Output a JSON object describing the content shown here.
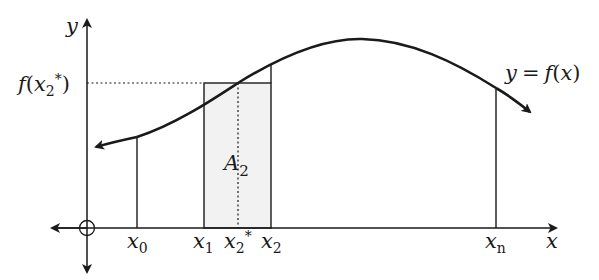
{
  "diagram": {
    "colors": {
      "stroke": "#1a1a1a",
      "rect_fill": "#f2f2f2",
      "background": "#ffffff"
    },
    "axes": {
      "x_label": "x",
      "y_label": "y",
      "origin_marker": "circle-plus"
    },
    "curve_label": {
      "lhs": "y",
      "eq": "=",
      "rhs_f": "f",
      "rhs_open": "(",
      "rhs_x": "x",
      "rhs_close": ")"
    },
    "y_tick_label": {
      "f": "f",
      "open": "(",
      "x": "x",
      "sub": "2",
      "sup": "*",
      "close": ")"
    },
    "x_ticks": [
      {
        "base": "x",
        "sub": "0",
        "sup": ""
      },
      {
        "base": "x",
        "sub": "1",
        "sup": ""
      },
      {
        "base": "x",
        "sub": "2",
        "sup": "*"
      },
      {
        "base": "x",
        "sub": "2",
        "sup": ""
      },
      {
        "base": "x",
        "sub": "n",
        "sup": ""
      }
    ],
    "area_label": {
      "base": "A",
      "sub": "2"
    }
  }
}
